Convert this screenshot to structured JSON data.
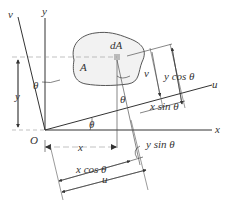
{
  "diagram": {
    "type": "coordinate-transformation",
    "labels": {
      "y_axis": "y",
      "x_axis": "x",
      "u_axis": "u",
      "v_axis": "v",
      "origin": "O",
      "area": "A",
      "element": "dA",
      "theta": "θ",
      "x_dim": "x",
      "y_dim": "y",
      "u_dim": "u",
      "v_dim": "v",
      "x_cos": "x cos θ",
      "y_sin": "y sin θ",
      "y_cos": "y cos θ",
      "x_sin": "x sin θ"
    },
    "colors": {
      "line": "#333333",
      "area_fill": "#f2f2f2",
      "element_fill": "#bbbbbb",
      "dash": "#999999"
    }
  }
}
